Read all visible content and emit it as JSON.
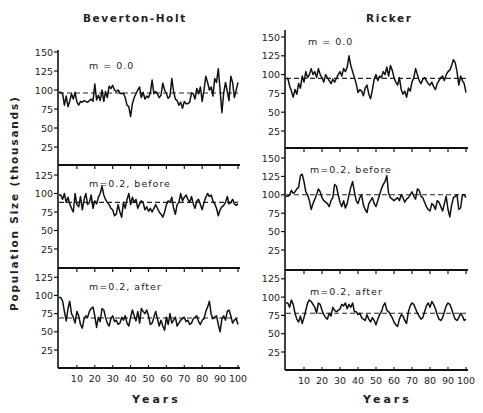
{
  "figure": {
    "ylabel": "Population Size (thousands)",
    "columns": [
      {
        "title": "Beverton-Holt",
        "xlabel": "Years"
      },
      {
        "title": "Ricker",
        "xlabel": "Years"
      }
    ],
    "xticks": [
      "10",
      "20",
      "30",
      "40",
      "50",
      "60",
      "70",
      "80",
      "90",
      "100"
    ]
  },
  "chart_data": [
    {
      "type": "line",
      "title": "Beverton-Holt",
      "panel_label": "m = 0.0",
      "xlabel": "Years",
      "ylabel": "Population Size (thousands)",
      "xlim": [
        0,
        100
      ],
      "ylim": [
        0,
        150
      ],
      "yticks": [
        25,
        50,
        75,
        100,
        125,
        150
      ],
      "equilibrium": 96,
      "x_step": 1,
      "values": [
        97,
        95,
        80,
        92,
        78,
        85,
        95,
        88,
        97,
        84,
        80,
        85,
        84,
        86,
        85,
        84,
        86,
        88,
        85,
        108,
        87,
        93,
        86,
        100,
        85,
        98,
        90,
        105,
        102,
        106,
        100,
        98,
        100,
        96,
        95,
        96,
        90,
        80,
        78,
        65,
        82,
        90,
        95,
        100,
        104,
        90,
        97,
        88,
        92,
        90,
        96,
        113,
        95,
        98,
        95,
        90,
        93,
        109,
        100,
        95,
        89,
        92,
        115,
        98,
        88,
        86,
        80,
        84,
        76,
        85,
        82,
        82,
        84,
        96,
        95,
        88,
        102,
        95,
        104,
        85,
        100,
        118,
        110,
        100,
        104,
        92,
        115,
        110,
        128,
        100,
        70,
        96,
        110,
        98,
        86,
        118,
        110,
        90,
        100,
        110
      ]
    },
    {
      "type": "line",
      "title": "Beverton-Holt",
      "panel_label": "m=0.2, before",
      "xlabel": "Years",
      "ylabel": "Population Size (thousands)",
      "xlim": [
        0,
        100
      ],
      "ylim": [
        0,
        125
      ],
      "yticks": [
        25,
        50,
        75,
        100,
        125
      ],
      "equilibrium": 88,
      "x_step": 1,
      "values": [
        98,
        92,
        100,
        88,
        95,
        86,
        80,
        75,
        100,
        85,
        82,
        96,
        78,
        92,
        100,
        85,
        88,
        98,
        80,
        90,
        86,
        95,
        100,
        110,
        98,
        92,
        88,
        85,
        80,
        78,
        70,
        72,
        85,
        75,
        68,
        88,
        80,
        92,
        100,
        85,
        95,
        88,
        92,
        80,
        86,
        90,
        88,
        78,
        82,
        76,
        80,
        75,
        80,
        85,
        80,
        75,
        72,
        68,
        75,
        85,
        90,
        88,
        95,
        80,
        72,
        85,
        88,
        100,
        90,
        95,
        98,
        92,
        88,
        96,
        86,
        80,
        90,
        92,
        85,
        78,
        88,
        95,
        100,
        96,
        98,
        90,
        86,
        80,
        70,
        78,
        82,
        84,
        88,
        96,
        86,
        88,
        92,
        86,
        84,
        86
      ]
    },
    {
      "type": "line",
      "title": "Beverton-Holt",
      "panel_label": "m=0.2, after",
      "xlabel": "Years",
      "ylabel": "Population Size (thousands)",
      "xlim": [
        0,
        100
      ],
      "ylim": [
        0,
        125
      ],
      "yticks": [
        25,
        50,
        75,
        100,
        125
      ],
      "equilibrium": 69,
      "x_step": 1,
      "values": [
        97,
        92,
        78,
        65,
        82,
        92,
        75,
        70,
        62,
        78,
        72,
        60,
        55,
        68,
        72,
        70,
        78,
        82,
        84,
        72,
        56,
        70,
        64,
        82,
        80,
        70,
        62,
        58,
        68,
        72,
        64,
        66,
        60,
        62,
        70,
        66,
        72,
        62,
        58,
        70,
        80,
        72,
        65,
        78,
        62,
        82,
        78,
        75,
        80,
        72,
        60,
        62,
        70,
        78,
        68,
        58,
        66,
        58,
        52,
        70,
        60,
        75,
        62,
        66,
        70,
        58,
        62,
        66,
        68,
        70,
        64,
        66,
        60,
        62,
        68,
        70,
        72,
        64,
        60,
        66,
        68,
        78,
        84,
        92,
        74,
        68,
        70,
        72,
        60,
        50,
        68,
        72,
        66,
        78,
        80,
        72,
        62,
        66,
        68,
        60
      ]
    },
    {
      "type": "line",
      "title": "Ricker",
      "panel_label": "m = 0.0",
      "xlabel": "Years",
      "ylabel": "Population Size (thousands)",
      "xlim": [
        0,
        100
      ],
      "ylim": [
        0,
        150
      ],
      "yticks": [
        25,
        50,
        75,
        100,
        125,
        150
      ],
      "equilibrium": 95,
      "x_step": 1,
      "values": [
        95,
        85,
        78,
        70,
        80,
        74,
        88,
        82,
        98,
        90,
        104,
        96,
        100,
        108,
        100,
        104,
        96,
        108,
        100,
        96,
        90,
        100,
        96,
        92,
        88,
        94,
        90,
        95,
        100,
        104,
        98,
        108,
        104,
        110,
        125,
        112,
        104,
        96,
        88,
        76,
        80,
        78,
        72,
        82,
        86,
        74,
        68,
        80,
        94,
        100,
        92,
        98,
        96,
        104,
        100,
        110,
        98,
        112,
        106,
        96,
        90,
        86,
        96,
        80,
        74,
        78,
        70,
        82,
        78,
        90,
        96,
        108,
        100,
        92,
        88,
        94,
        96,
        92,
        88,
        86,
        90,
        84,
        80,
        88,
        92,
        96,
        98,
        92,
        100,
        104,
        106,
        112,
        120,
        116,
        104,
        86,
        98,
        92,
        88,
        76
      ]
    },
    {
      "type": "line",
      "title": "Ricker",
      "panel_label": "m=0.2, before",
      "xlabel": "Years",
      "ylabel": "Population Size (thousands)",
      "xlim": [
        0,
        100
      ],
      "ylim": [
        0,
        150
      ],
      "yticks": [
        25,
        50,
        75,
        100,
        125,
        150
      ],
      "equilibrium": 100,
      "x_step": 1,
      "values": [
        98,
        100,
        106,
        102,
        104,
        108,
        110,
        126,
        128,
        118,
        104,
        100,
        92,
        80,
        88,
        94,
        100,
        108,
        104,
        96,
        92,
        90,
        88,
        84,
        92,
        96,
        114,
        112,
        100,
        90,
        84,
        92,
        82,
        88,
        100,
        110,
        118,
        104,
        92,
        88,
        96,
        100,
        86,
        80,
        76,
        88,
        92,
        96,
        88,
        84,
        92,
        100,
        108,
        114,
        118,
        126,
        102,
        96,
        94,
        92,
        94,
        96,
        92,
        100,
        96,
        90,
        94,
        96,
        100,
        104,
        98,
        94,
        108,
        106,
        98,
        96,
        90,
        84,
        80,
        78,
        88,
        86,
        80,
        92,
        90,
        84,
        78,
        88,
        98,
        80,
        70,
        86,
        96,
        98,
        100,
        80,
        82,
        100,
        100,
        96
      ]
    },
    {
      "type": "line",
      "title": "Ricker",
      "panel_label": "m=0.2, after",
      "xlabel": "Years",
      "ylabel": "Population Size (thousands)",
      "xlim": [
        0,
        100
      ],
      "ylim": [
        0,
        125
      ],
      "yticks": [
        25,
        50,
        75,
        100,
        125
      ],
      "equilibrium": 78,
      "x_step": 1,
      "values": [
        92,
        86,
        96,
        90,
        78,
        70,
        66,
        74,
        64,
        72,
        82,
        92,
        96,
        94,
        90,
        86,
        78,
        92,
        90,
        82,
        76,
        72,
        70,
        78,
        74,
        86,
        82,
        80,
        82,
        84,
        90,
        88,
        92,
        84,
        90,
        86,
        92,
        80,
        80,
        76,
        78,
        72,
        70,
        68,
        76,
        70,
        66,
        72,
        68,
        62,
        70,
        76,
        80,
        88,
        92,
        82,
        80,
        76,
        72,
        66,
        62,
        60,
        70,
        76,
        74,
        68,
        64,
        80,
        88,
        92,
        90,
        84,
        78,
        74,
        70,
        72,
        80,
        88,
        92,
        86,
        94,
        90,
        84,
        76,
        70,
        68,
        72,
        80,
        88,
        92,
        90,
        84,
        76,
        70,
        68,
        72,
        78,
        74,
        68,
        70
      ]
    }
  ]
}
